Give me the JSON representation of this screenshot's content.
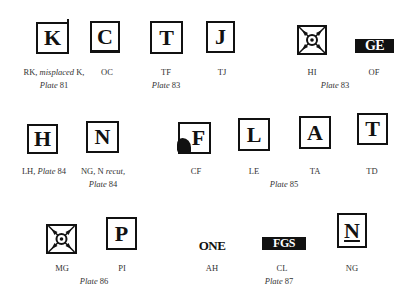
{
  "figure": {
    "row1": {
      "items": [
        {
          "letter": "K",
          "label": "RK,",
          "label_italic": "misplaced",
          "label_tail": "K,"
        },
        {
          "letter": "C",
          "label": "OC"
        },
        {
          "letter": "T",
          "label": "TF"
        },
        {
          "letter": "J",
          "label": "TJ"
        },
        {
          "letter": "",
          "label": "HI",
          "icon": "sunburst-ornament"
        },
        {
          "letter": "GE",
          "label": "OF"
        }
      ],
      "plates": [
        {
          "word": "Plate",
          "num": "81"
        },
        {
          "word": "Plate",
          "num": "83"
        },
        {
          "word": "Plate",
          "num": "83"
        }
      ]
    },
    "row2": {
      "items": [
        {
          "letter": "H",
          "label": "LH,",
          "label_italic": "Plate",
          "label_tail": "84"
        },
        {
          "letter": "N",
          "label": "NG, N",
          "label_italic": "recut,"
        },
        {
          "letter": "F",
          "label": "CF"
        },
        {
          "letter": "L",
          "label": "LE"
        },
        {
          "letter": "A",
          "label": "TA"
        },
        {
          "letter": "T",
          "label": "TD"
        }
      ],
      "plates": [
        {
          "word": "Plate",
          "num": "84"
        },
        {
          "word": "Plate",
          "num": "85"
        }
      ]
    },
    "row3": {
      "items": [
        {
          "letter": "",
          "label": "MG",
          "icon": "sunburst-ornament"
        },
        {
          "letter": "P",
          "label": "PI"
        },
        {
          "letter": "ONE",
          "label": "AH"
        },
        {
          "letter": "FGS",
          "label": "CL"
        },
        {
          "letter": "N",
          "label": "NG"
        }
      ],
      "plates": [
        {
          "word": "Plate",
          "num": "86"
        },
        {
          "word": "Plate",
          "num": "87"
        }
      ]
    }
  }
}
